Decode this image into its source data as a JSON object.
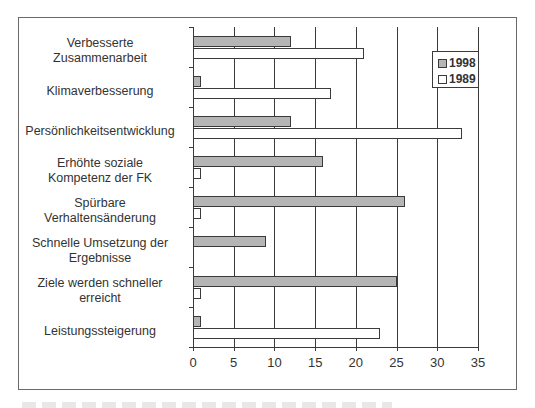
{
  "chart_data": {
    "type": "bar",
    "orientation": "horizontal",
    "title": "",
    "xlabel": "",
    "ylabel": "",
    "xlim": [
      0,
      35
    ],
    "x_ticks": [
      "0",
      "5",
      "10",
      "15",
      "20",
      "25",
      "30",
      "35"
    ],
    "grid": "vertical gridlines at each x tick",
    "legend_position": "upper right inside plot",
    "categories": [
      "Verbesserte Zusammenarbeit",
      "Klimaverbesserung",
      "Persönlichkeitsentwicklung",
      "Erhöhte soziale Kompetenz der FK",
      "Spürbare Verhaltensänderung",
      "Schnelle Umsetzung der Ergebnisse",
      "Ziele werden schneller erreicht",
      "Leistungssteigerung"
    ],
    "series": [
      {
        "name": "1998",
        "color": "#b5b5b5",
        "values": [
          12,
          1,
          12,
          16,
          26,
          9,
          25,
          1
        ]
      },
      {
        "name": "1989",
        "color": "#ffffff",
        "values": [
          21,
          17,
          33,
          1,
          1,
          0,
          1,
          23
        ]
      }
    ]
  },
  "labels": {
    "categories": [
      [
        "Verbesserte",
        "Zusammenarbeit"
      ],
      [
        "Klimaverbesserung"
      ],
      [
        "Persönlichkeitsentwicklung"
      ],
      [
        "Erhöhte soziale",
        "Kompetenz der FK"
      ],
      [
        "Spürbare",
        "Verhaltensänderung"
      ],
      [
        "Schnelle Umsetzung der",
        "Ergebnisse"
      ],
      [
        "Ziele werden schneller",
        "erreicht"
      ],
      [
        "Leistungssteigerung"
      ]
    ]
  },
  "legend": {
    "items": [
      {
        "label": "1998"
      },
      {
        "label": "1989"
      }
    ]
  }
}
